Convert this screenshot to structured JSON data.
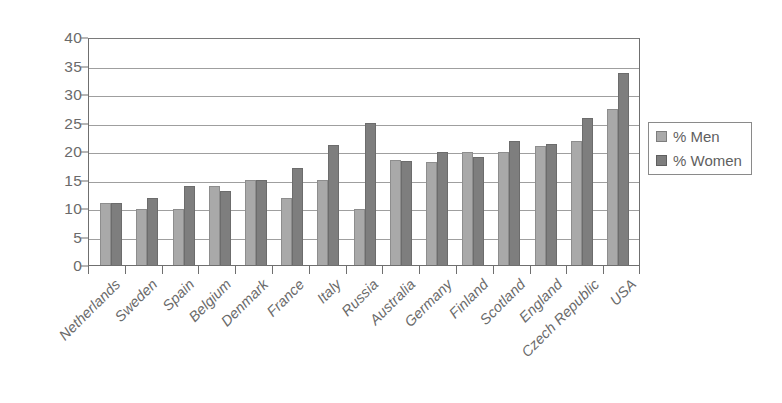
{
  "chart_data": {
    "type": "bar",
    "title": "",
    "subtitle": "",
    "xlabel": "",
    "ylabel": "",
    "ylim": [
      0,
      40
    ],
    "ytick_step": 5,
    "ytick_labels": [
      "40",
      "35",
      "30",
      "25",
      "20",
      "15",
      "10",
      "5",
      "0"
    ],
    "ytick_values": [
      40,
      35,
      30,
      25,
      20,
      15,
      10,
      5,
      0
    ],
    "grid": true,
    "grid_axis": "y",
    "legend_position": "right",
    "orientation": "vertical",
    "grouping": "grouped",
    "categories": [
      "Netherlands",
      "Sweden",
      "Spain",
      "Belgium",
      "Denmark",
      "France",
      "Italy",
      "Russia",
      "Australia",
      "Germany",
      "Finland",
      "Scotland",
      "England",
      "Czech Republic",
      "USA"
    ],
    "series": [
      {
        "name": "% Men",
        "color": "#a9a9a9",
        "values": [
          10.9,
          9.9,
          9.9,
          13.9,
          15.0,
          11.8,
          15.0,
          9.8,
          18.4,
          18.0,
          19.8,
          19.8,
          20.8,
          21.8,
          27.3
        ]
      },
      {
        "name": "% Women",
        "color": "#7e7e7e",
        "values": [
          10.9,
          11.8,
          13.8,
          12.9,
          15.0,
          17.0,
          21.1,
          25.0,
          18.2,
          19.9,
          18.9,
          21.8,
          21.3,
          25.8,
          33.7
        ]
      }
    ],
    "annotations": []
  },
  "legend": {
    "items": [
      {
        "label": "% Men",
        "color": "#a9a9a9"
      },
      {
        "label": "% Women",
        "color": "#7e7e7e"
      }
    ]
  },
  "colors": {
    "men": "#a9a9a9",
    "women": "#7e7e7e",
    "axis": "#6f6f6f",
    "grid": "#8e8e8e",
    "text": "#6a6a6a",
    "background": "#ffffff"
  }
}
